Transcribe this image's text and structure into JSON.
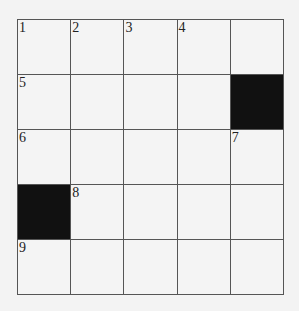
{
  "puzzle": {
    "type": "crossword",
    "rows": 5,
    "cols": 5,
    "cells": [
      [
        {
          "num": "1",
          "block": false
        },
        {
          "num": "2",
          "block": false
        },
        {
          "num": "3",
          "block": false
        },
        {
          "num": "4",
          "block": false
        },
        {
          "num": "",
          "block": false
        }
      ],
      [
        {
          "num": "5",
          "block": false
        },
        {
          "num": "",
          "block": false
        },
        {
          "num": "",
          "block": false
        },
        {
          "num": "",
          "block": false
        },
        {
          "num": "",
          "block": true
        }
      ],
      [
        {
          "num": "6",
          "block": false
        },
        {
          "num": "",
          "block": false
        },
        {
          "num": "",
          "block": false
        },
        {
          "num": "",
          "block": false
        },
        {
          "num": "7",
          "block": false
        }
      ],
      [
        {
          "num": "",
          "block": true
        },
        {
          "num": "8",
          "block": false
        },
        {
          "num": "",
          "block": false
        },
        {
          "num": "",
          "block": false
        },
        {
          "num": "",
          "block": false
        }
      ],
      [
        {
          "num": "9",
          "block": false
        },
        {
          "num": "",
          "block": false
        },
        {
          "num": "",
          "block": false
        },
        {
          "num": "",
          "block": false
        },
        {
          "num": "",
          "block": false
        }
      ]
    ]
  }
}
